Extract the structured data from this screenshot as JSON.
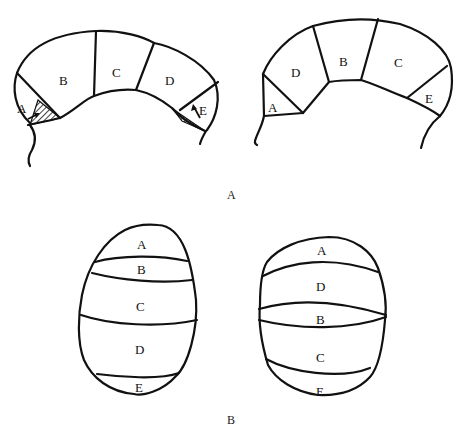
{
  "figure": {
    "panel_a": {
      "caption": "A",
      "left_diagram": {
        "segments": [
          "A",
          "B",
          "C",
          "D",
          "E"
        ],
        "annotations": [
          "hatched region near A with arrow",
          "hatched region near E with arrow"
        ]
      },
      "right_diagram": {
        "segments": [
          "D",
          "B",
          "C",
          "A",
          "E"
        ]
      }
    },
    "panel_b": {
      "caption": "B",
      "left_diagram": {
        "bands_top_to_bottom": [
          "A",
          "B",
          "C",
          "D",
          "E"
        ]
      },
      "right_diagram": {
        "bands_top_to_bottom": [
          "A",
          "D",
          "B",
          "C",
          "E"
        ]
      }
    }
  },
  "colors": {
    "line": "#111111",
    "background": "#ffffff"
  }
}
